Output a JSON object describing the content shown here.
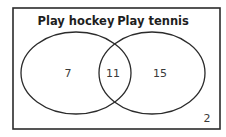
{
  "diagram": {
    "type": "venn",
    "universe_value": "2",
    "sets": [
      {
        "label": "Play hockey",
        "only_value": "7"
      },
      {
        "label": "Play tennis",
        "only_value": "15"
      }
    ],
    "intersection_value": "11",
    "colors": {
      "stroke": "#2b2b2b",
      "text": "#3a3a3a",
      "background": "#ffffff"
    }
  }
}
